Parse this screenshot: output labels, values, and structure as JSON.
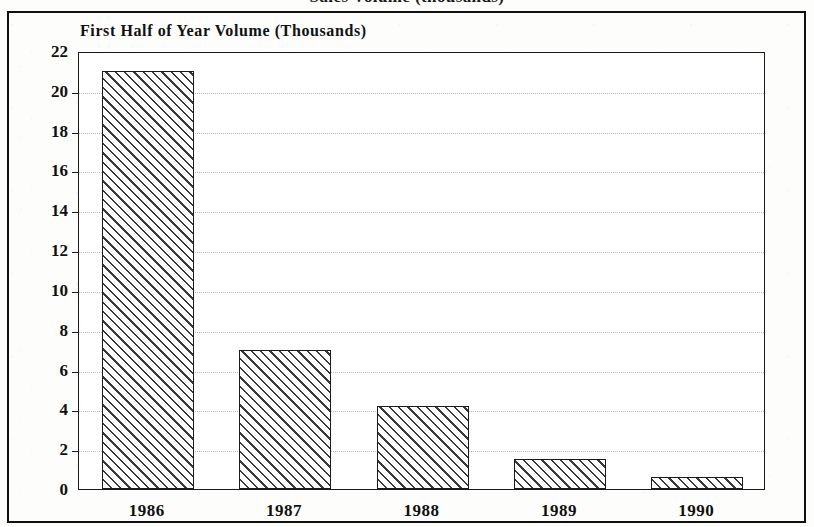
{
  "figure": {
    "supertitle_cropped": "Sales Volume (thousands)",
    "subtitle": "First Half of Year Volume (Thousands)"
  },
  "chart_data": {
    "type": "bar",
    "title": "First Half of Year Volume (Thousands)",
    "xlabel": "",
    "ylabel": "",
    "categories": [
      "1986",
      "1987",
      "1988",
      "1989",
      "1990"
    ],
    "values": [
      21.0,
      7.0,
      4.15,
      1.5,
      0.6
    ],
    "ylim": [
      0,
      22
    ],
    "yticks": [
      0,
      2,
      4,
      6,
      8,
      10,
      12,
      14,
      16,
      18,
      20,
      22
    ],
    "ytick_labels": [
      "0",
      "2",
      "4",
      "6",
      "8",
      "10",
      "12",
      "14",
      "16",
      "18",
      "20",
      "22"
    ],
    "grid": true,
    "grid_style": "dotted-horizontal",
    "legend": null,
    "bar_fill": "diagonal-hatch-45",
    "bar_edge_color": "#1b1b1b",
    "background_color": "#ffffff"
  }
}
